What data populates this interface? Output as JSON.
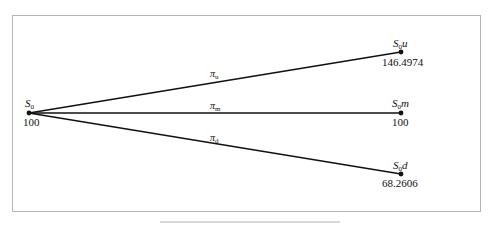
{
  "diagram": {
    "type": "trinomial-tree",
    "root": {
      "label": "S",
      "subscript": "0",
      "suffix": "",
      "value": "100"
    },
    "branches": [
      {
        "id": "up",
        "prob_symbol": "π",
        "prob_subscript": "u",
        "node_label": "S",
        "node_subscript": "0",
        "node_suffix": "u",
        "value": "146.4974"
      },
      {
        "id": "mid",
        "prob_symbol": "π",
        "prob_subscript": "m",
        "node_label": "S",
        "node_subscript": "0",
        "node_suffix": "m",
        "value": "100"
      },
      {
        "id": "down",
        "prob_symbol": "π",
        "prob_subscript": "d",
        "node_label": "S",
        "node_subscript": "0",
        "node_suffix": "d",
        "value": "68.2606"
      }
    ],
    "colors": {
      "line": "#111111",
      "border": "#b5b5b5",
      "background": "#ffffff"
    }
  },
  "caption": {
    "text": ""
  }
}
